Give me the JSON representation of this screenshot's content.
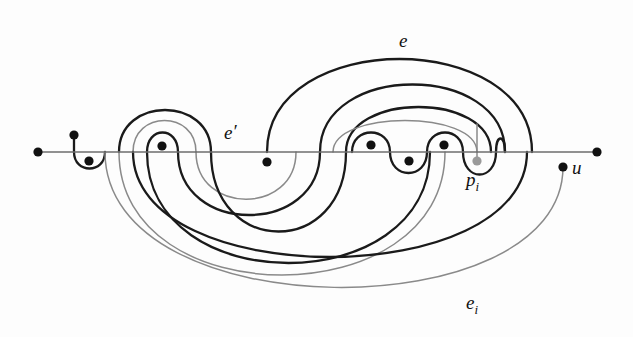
{
  "figure": {
    "background_color": "#fdfdfd",
    "colors": {
      "black_curve": "#1a1a1a",
      "gray_curve": "#8a8a8a",
      "baseline": "#6e6e6e",
      "dot_black": "#111111",
      "dot_gray": "#9a9a9a"
    },
    "stroke_widths": {
      "black_curve": 2.3,
      "gray_curve": 1.5,
      "baseline": 1.6
    }
  },
  "baseline": {
    "name": "horizontal-axis",
    "y": 152,
    "x_start": 38,
    "x_end": 597
  },
  "labels": [
    {
      "id": "e",
      "text": "e",
      "sub": "",
      "x": 399,
      "y": 47
    },
    {
      "id": "e-prime",
      "text": "e",
      "sub": "",
      "prime": "′",
      "x": 224,
      "y": 139
    },
    {
      "id": "e-i",
      "text": "e",
      "sub": "i",
      "x": 466,
      "y": 309
    },
    {
      "id": "p-i",
      "text": "p",
      "sub": "i",
      "x": 466,
      "y": 186
    },
    {
      "id": "u",
      "text": "u",
      "sub": "",
      "x": 572,
      "y": 174
    }
  ],
  "points": [
    {
      "id": "endpoint-left",
      "x": 38,
      "y": 152,
      "color": "#111111",
      "r": 4.6,
      "label": ""
    },
    {
      "id": "vertex-1",
      "x": 74,
      "y": 135,
      "color": "#111111",
      "r": 4.6,
      "label": ""
    },
    {
      "id": "vertex-2",
      "x": 89,
      "y": 161,
      "color": "#111111",
      "r": 4.6,
      "label": ""
    },
    {
      "id": "vertex-3",
      "x": 162,
      "y": 146,
      "color": "#111111",
      "r": 4.6,
      "label": ""
    },
    {
      "id": "vertex-4",
      "x": 267,
      "y": 162,
      "color": "#111111",
      "r": 4.6,
      "label": ""
    },
    {
      "id": "vertex-5",
      "x": 371,
      "y": 145,
      "color": "#111111",
      "r": 4.6,
      "label": ""
    },
    {
      "id": "vertex-6",
      "x": 409,
      "y": 161,
      "color": "#111111",
      "r": 4.6,
      "label": ""
    },
    {
      "id": "vertex-7",
      "x": 444,
      "y": 145,
      "color": "#111111",
      "r": 4.6,
      "label": ""
    },
    {
      "id": "point-pi",
      "x": 477,
      "y": 161,
      "color": "#9a9a9a",
      "r": 4.6,
      "label": "p_i"
    },
    {
      "id": "point-u",
      "x": 563,
      "y": 167,
      "color": "#111111",
      "r": 4.6,
      "label": "u"
    },
    {
      "id": "endpoint-right",
      "x": 597,
      "y": 152,
      "color": "#111111",
      "r": 4.6,
      "label": ""
    }
  ],
  "curves": [
    {
      "id": "stub-left",
      "color": "black",
      "d": "M 74,135 L 74,152"
    },
    {
      "id": "dip-left-small",
      "color": "black",
      "d": "M 74,152 C 74,174 105,174 105,152"
    },
    {
      "id": "arc-e-outer",
      "color": "black",
      "d": "M 267,152 C 267,28 532,28 532,152"
    },
    {
      "id": "arc-e-second",
      "color": "black",
      "d": "M 320,152 C 320,62 505,62 505,152"
    },
    {
      "id": "arc-e-third",
      "color": "black",
      "d": "M 346,152 C 346,92 491,92 491,152"
    },
    {
      "id": "arc-e-gray-inner",
      "color": "gray",
      "d": "M 333,152 C 333,110 477,110 477,152"
    },
    {
      "id": "loop-small-black-left",
      "color": "black",
      "d": "M 147,152 C 147,126 178,126 178,152"
    },
    {
      "id": "arc-left-gray-mid",
      "color": "gray",
      "d": "M 133,152 C 133,110 196,110 196,152"
    },
    {
      "id": "arc-left-black-outer",
      "color": "black",
      "d": "M 119,152 C 119,96 211,96 211,152"
    },
    {
      "id": "sine-bump-1",
      "color": "black",
      "d": "M 352,152 C 352,126 390,126 390,152"
    },
    {
      "id": "sine-dip-1",
      "color": "black",
      "d": "M 390,152 C 390,180 427,180 427,152"
    },
    {
      "id": "sine-bump-2",
      "color": "black",
      "d": "M 427,152 C 427,126 463,126 463,152"
    },
    {
      "id": "sine-dip-2",
      "color": "black",
      "d": "M 463,152 C 463,182 496,182 496,152"
    },
    {
      "id": "gray-descend-to-pi",
      "color": "gray",
      "d": "M 477,124 L 477,161"
    },
    {
      "id": "swirl-black-inner",
      "color": "black",
      "d": "M 178,152 C 178,236 320,236 320,152"
    },
    {
      "id": "swirl-gray-inner",
      "color": "gray",
      "d": "M 196,152 C 196,215 296,215 296,152"
    },
    {
      "id": "swirl-black-mid",
      "color": "black",
      "d": "M 211,152 C 211,258 346,258 346,152"
    },
    {
      "id": "swirl-black-big",
      "color": "black",
      "d": "M 147,152 C 147,300 430,300 430,152"
    },
    {
      "id": "swirl-gray-big",
      "color": "gray",
      "d": "M 119,152 C 119,316 445,316 445,152"
    },
    {
      "id": "lower-black-outer",
      "color": "black",
      "d": "M 133,152 C 133,292 527,292 527,152"
    },
    {
      "id": "lower-gray-outer",
      "color": "gray",
      "d": "M 105,152 C 105,330 563,330 563,167"
    },
    {
      "id": "right-riser-black",
      "color": "black",
      "d": "M 496,152 C 496,134 505,134 505,152"
    }
  ]
}
